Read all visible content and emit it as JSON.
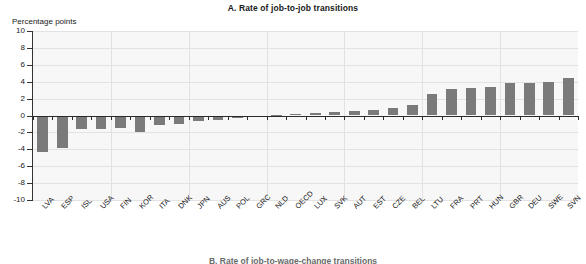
{
  "chart_data": {
    "type": "bar",
    "title": "A. Rate of job-to-job transitions",
    "ylabel": "Percentage points",
    "xlabel": "",
    "ylim": [
      -10,
      10
    ],
    "yticks": [
      10,
      8,
      6,
      4,
      2,
      0,
      -2,
      -4,
      -6,
      -8,
      -10
    ],
    "ytick_labels": [
      "10",
      "8",
      "6",
      "4",
      "2",
      "0",
      "-2",
      "-4",
      "-6",
      "-8",
      "-10"
    ],
    "grid": true,
    "legend": "none",
    "categories": [
      "LVA",
      "ESP",
      "ISL",
      "USA",
      "FIN",
      "KOR",
      "ITA",
      "DNK",
      "JPN",
      "AUS",
      "POL",
      "GRC",
      "NLD",
      "OECD",
      "LUX",
      "SVK",
      "AUT",
      "EST",
      "CZE",
      "BEL",
      "LTU",
      "FRA",
      "PRT",
      "HUN",
      "GBR",
      "DEU",
      "SWE",
      "SVN"
    ],
    "values": [
      -4.3,
      -3.8,
      -1.6,
      -1.6,
      -1.5,
      -1.9,
      -1.1,
      -1.0,
      -0.6,
      -0.5,
      -0.3,
      -0.2,
      0.1,
      0.2,
      0.3,
      0.4,
      0.5,
      0.7,
      0.9,
      1.2,
      2.6,
      3.1,
      3.3,
      3.4,
      3.8,
      3.8,
      4.0,
      4.4
    ],
    "bar_color": "#7a7a7a",
    "plot_background": "#f7f7f7",
    "axis_color": "#2b2b2b"
  },
  "bottom_caption": "B. Rate of job-to-wage-change transitions"
}
